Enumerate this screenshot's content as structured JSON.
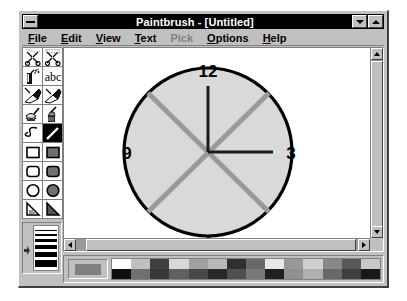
{
  "window": {
    "title": "Paintbrush - [Untitled]",
    "system_menu_icon": "system-menu-icon",
    "minimize_icon": "minimize-icon",
    "maximize_icon": "maximize-icon"
  },
  "menu": {
    "items": [
      {
        "label": "File",
        "mnemonic": "F",
        "disabled": false
      },
      {
        "label": "Edit",
        "mnemonic": "E",
        "disabled": false
      },
      {
        "label": "View",
        "mnemonic": "V",
        "disabled": false
      },
      {
        "label": "Text",
        "mnemonic": "T",
        "disabled": false
      },
      {
        "label": "Pick",
        "mnemonic": "P",
        "disabled": true
      },
      {
        "label": "Options",
        "mnemonic": "O",
        "disabled": false
      },
      {
        "label": "Help",
        "mnemonic": "H",
        "disabled": false
      }
    ]
  },
  "tools": [
    {
      "name": "scissors-freeform-select-tool",
      "selected": false
    },
    {
      "name": "scissors-rectangle-select-tool",
      "selected": false
    },
    {
      "name": "airbrush-tool",
      "selected": false
    },
    {
      "name": "text-tool",
      "selected": false
    },
    {
      "name": "color-eraser-tool",
      "selected": false
    },
    {
      "name": "eraser-tool",
      "selected": false
    },
    {
      "name": "paint-roller-fill-tool",
      "selected": false
    },
    {
      "name": "brush-tool",
      "selected": false
    },
    {
      "name": "curve-tool",
      "selected": false
    },
    {
      "name": "line-tool",
      "selected": true
    },
    {
      "name": "box-outline-tool",
      "selected": false
    },
    {
      "name": "box-filled-tool",
      "selected": false
    },
    {
      "name": "rounded-box-outline-tool",
      "selected": false
    },
    {
      "name": "rounded-box-filled-tool",
      "selected": false
    },
    {
      "name": "circle-outline-tool",
      "selected": false
    },
    {
      "name": "circle-filled-tool",
      "selected": false
    },
    {
      "name": "polygon-outline-tool",
      "selected": false
    },
    {
      "name": "polygon-filled-tool",
      "selected": false
    }
  ],
  "line_width": {
    "name": "line-width-selector",
    "widths": [
      1,
      2,
      3,
      4,
      5,
      7
    ],
    "selected_index": 1
  },
  "palette": {
    "current_color": "#808080",
    "swatches_top": [
      "#ffffff",
      "#c0c0c0",
      "#404040",
      "#d8d8d8",
      "#a0a0a0",
      "#b8b8b8",
      "#303030",
      "#686868",
      "#e8e8e8",
      "#989898",
      "#d0d0d0",
      "#888888",
      "#585858",
      "#c8c8c8"
    ],
    "swatches_bottom": [
      "#101010",
      "#707070",
      "#383838",
      "#606060",
      "#484848",
      "#282828",
      "#505050",
      "#787878",
      "#202020",
      "#909090",
      "#b0b0b0",
      "#686868",
      "#404040",
      "#181818"
    ]
  },
  "scrollbars": {
    "vertical_name": "vertical-scrollbar",
    "horizontal_name": "horizontal-scrollbar"
  },
  "canvas": {
    "drawing_name": "clock-face-drawing",
    "labels": {
      "twelve": "12",
      "three": "3",
      "six": "6",
      "nine": "9"
    },
    "colors": {
      "face_fill": "#d9d9d9",
      "face_outline": "#000000",
      "hand": "#1a1a1a",
      "diagonal": "#9a9a9a"
    }
  }
}
